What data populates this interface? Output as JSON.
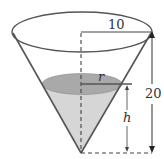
{
  "diagram": {
    "labels": {
      "top_radius": "10",
      "height": "20",
      "water_radius": "r",
      "water_height": "h"
    },
    "colors": {
      "outline": "#555555",
      "water_surface": "#a9a9a9",
      "water_body": "#d6d6d6",
      "dashed": "#444444"
    }
  }
}
